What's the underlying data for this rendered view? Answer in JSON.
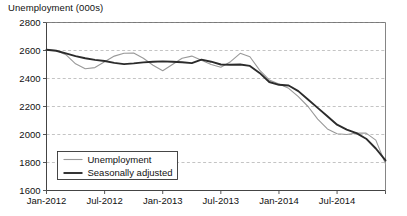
{
  "chart_data": {
    "type": "line",
    "title": "Unemployment (000s)",
    "xlabel": "",
    "ylabel": "",
    "ylim": [
      1600,
      2800
    ],
    "yticks": [
      1600,
      1800,
      2000,
      2200,
      2400,
      2600,
      2800
    ],
    "ytick_labels": [
      "1600",
      "1800",
      "2000",
      "2200",
      "2400",
      "2600",
      "2800"
    ],
    "grid": true,
    "legend_position": "bottom-left",
    "xticks": [
      0,
      6,
      12,
      18,
      24,
      30
    ],
    "xtick_labels": [
      "Jan-2012",
      "Jul-2012",
      "Jan-2013",
      "Jul-2013",
      "Jan-2014",
      "Jul-2014"
    ],
    "x": [
      "Jan-2012",
      "Feb-2012",
      "Mar-2012",
      "Apr-2012",
      "May-2012",
      "Jun-2012",
      "Jul-2012",
      "Aug-2012",
      "Sep-2012",
      "Oct-2012",
      "Nov-2012",
      "Dec-2012",
      "Jan-2013",
      "Feb-2013",
      "Mar-2013",
      "Apr-2013",
      "May-2013",
      "Jun-2013",
      "Jul-2013",
      "Aug-2013",
      "Sep-2013",
      "Oct-2013",
      "Nov-2013",
      "Dec-2013",
      "Jan-2014",
      "Feb-2014",
      "Mar-2014",
      "Apr-2014",
      "May-2014",
      "Jun-2014",
      "Jul-2014",
      "Aug-2014",
      "Sep-2014",
      "Oct-2014",
      "Nov-2014",
      "Dec-2014"
    ],
    "series": [
      {
        "name": "Unemployment",
        "color": "#999999",
        "width": 1.1,
        "values": [
          2605,
          2600,
          2570,
          2505,
          2470,
          2478,
          2520,
          2560,
          2580,
          2582,
          2545,
          2495,
          2455,
          2500,
          2545,
          2560,
          2530,
          2500,
          2480,
          2520,
          2580,
          2555,
          2460,
          2390,
          2360,
          2330,
          2270,
          2200,
          2110,
          2040,
          2005,
          2000,
          2010,
          2010,
          1960,
          1790
        ]
      },
      {
        "name": "Seasonally adjusted",
        "color": "#2b2b2b",
        "width": 1.9,
        "values": [
          2605,
          2598,
          2580,
          2560,
          2545,
          2533,
          2525,
          2512,
          2503,
          2508,
          2515,
          2520,
          2522,
          2520,
          2516,
          2510,
          2535,
          2520,
          2500,
          2498,
          2500,
          2490,
          2440,
          2375,
          2355,
          2350,
          2310,
          2250,
          2190,
          2130,
          2070,
          2035,
          2010,
          1970,
          1900,
          1815
        ]
      }
    ]
  },
  "legend": {
    "items": [
      {
        "label": "Unemployment"
      },
      {
        "label": "Seasonally adjusted"
      }
    ]
  }
}
